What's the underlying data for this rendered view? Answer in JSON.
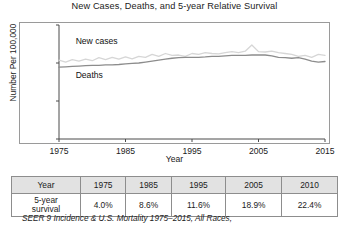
{
  "chart_data": {
    "type": "line",
    "title": "New Cases, Deaths, and 5-year Relative Survival",
    "xlabel": "Year",
    "ylabel": "Number Per 100,000 Persons",
    "xlim": [
      1975,
      2015
    ],
    "ylim": [
      0,
      6
    ],
    "yticks": [
      "0",
      "2",
      "4",
      "6"
    ],
    "ytick_values": [
      0,
      2,
      4,
      6
    ],
    "xticks": [
      "1975",
      "1985",
      "1995",
      "2005",
      "2015"
    ],
    "xtick_values": [
      1975,
      1985,
      1995,
      2005,
      2015
    ],
    "grid": false,
    "legend_position": "inline-labels",
    "series": [
      {
        "name": "New cases",
        "color": "#d6d6d6",
        "label_x": 1977.5,
        "label_y": 5.15,
        "x": [
          1975,
          1976,
          1977,
          1978,
          1979,
          1980,
          1981,
          1982,
          1983,
          1984,
          1985,
          1986,
          1987,
          1988,
          1989,
          1990,
          1991,
          1992,
          1993,
          1994,
          1995,
          1996,
          1997,
          1998,
          1999,
          2000,
          2001,
          2002,
          2003,
          2004,
          2005,
          2006,
          2007,
          2008,
          2009,
          2010,
          2011,
          2012,
          2013,
          2014,
          2015
        ],
        "values": [
          4.15,
          4.05,
          4.18,
          4.1,
          4.2,
          4.12,
          4.28,
          4.18,
          4.3,
          4.2,
          4.32,
          4.22,
          4.35,
          4.3,
          4.45,
          4.35,
          4.5,
          4.4,
          4.42,
          4.35,
          4.5,
          4.45,
          4.55,
          4.5,
          4.48,
          4.55,
          4.6,
          4.55,
          4.62,
          4.95,
          4.6,
          4.58,
          4.62,
          4.55,
          4.5,
          4.45,
          4.35,
          4.4,
          4.3,
          4.45,
          4.4
        ]
      },
      {
        "name": "Deaths",
        "color": "#8c8c8c",
        "label_x": 1977.5,
        "label_y": 3.35,
        "x": [
          1975,
          1976,
          1977,
          1978,
          1979,
          1980,
          1981,
          1982,
          1983,
          1984,
          1985,
          1986,
          1987,
          1988,
          1989,
          1990,
          1991,
          1992,
          1993,
          1994,
          1995,
          1996,
          1997,
          1998,
          1999,
          2000,
          2001,
          2002,
          2003,
          2004,
          2005,
          2006,
          2007,
          2008,
          2009,
          2010,
          2011,
          2012,
          2013,
          2014,
          2015
        ],
        "values": [
          3.78,
          3.8,
          3.82,
          3.84,
          3.86,
          3.88,
          3.88,
          3.9,
          3.9,
          3.92,
          3.95,
          3.98,
          4.0,
          4.05,
          4.1,
          4.15,
          4.2,
          4.25,
          4.28,
          4.3,
          4.3,
          4.3,
          4.32,
          4.35,
          4.35,
          4.38,
          4.4,
          4.4,
          4.4,
          4.42,
          4.42,
          4.42,
          4.38,
          4.3,
          4.28,
          4.25,
          4.28,
          4.2,
          4.1,
          4.05,
          4.08
        ]
      }
    ]
  },
  "table": {
    "columns": [
      "Year",
      "1975",
      "1985",
      "1995",
      "2005",
      "2010"
    ],
    "row_label": "5-year survival",
    "row_label_line1": "5-year",
    "row_label_line2": "survival",
    "values": [
      "4.0%",
      "8.6%",
      "11.6%",
      "18.9%",
      "22.4%"
    ]
  },
  "footnote": "SEER 9 Incidence & U.S. Mortality 1975–2015, All Races,"
}
